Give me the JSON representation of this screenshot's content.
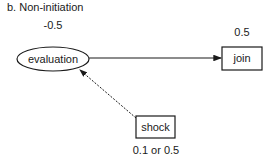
{
  "title": "b. Non-initiation",
  "nodes": {
    "evaluation": {
      "label": "evaluation",
      "shape": "ellipse",
      "value": "-0.5"
    },
    "join": {
      "label": "join",
      "shape": "box",
      "value": "0.5"
    },
    "shock": {
      "label": "shock",
      "shape": "box",
      "value": "0.1 or 0.5"
    }
  },
  "edges": [
    {
      "from": "evaluation",
      "to": "join",
      "style": "solid"
    },
    {
      "from": "shock",
      "to": "evaluation",
      "style": "dashed"
    }
  ]
}
